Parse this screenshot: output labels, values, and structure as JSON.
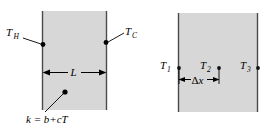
{
  "figure": {
    "background_color": "#ffffff",
    "slab_fill_color": "#d7d7d7",
    "slab_edge_color": "#4a4a4a",
    "ink_color": "#000000"
  },
  "left_diagram": {
    "name": "continuous-slab",
    "hot_face_label": "T",
    "hot_face_subscript": "H",
    "cold_face_label": "T",
    "cold_face_subscript": "C",
    "thickness_label": "L",
    "conductivity_label": "k = b+cT",
    "conductivity_label_parts": {
      "symbol": "k",
      "equals": "=",
      "expression": "b+cT"
    }
  },
  "right_diagram": {
    "name": "discretized-slab",
    "node_labels": [
      {
        "symbol": "T",
        "subscript": "1"
      },
      {
        "symbol": "T",
        "subscript": "2"
      },
      {
        "symbol": "T",
        "subscript": "3"
      }
    ],
    "spacing_label": "Δx",
    "spacing_label_parts": {
      "delta": "Δ",
      "variable": "x"
    }
  }
}
